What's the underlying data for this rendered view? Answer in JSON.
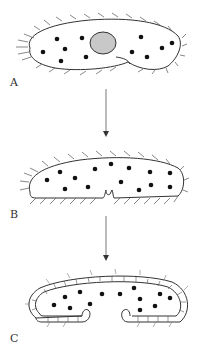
{
  "diagram": {
    "stages": [
      {
        "label": "A",
        "description": "ciliated cell with central nucleus and scattered dots, folding at one end"
      },
      {
        "label": "B",
        "description": "elongated ciliated cell with ventral notch"
      },
      {
        "label": "C",
        "description": "cell enclosed by double-layered wall with inward-curving opening"
      }
    ],
    "arrows": [
      {
        "from": "A",
        "to": "B"
      },
      {
        "from": "B",
        "to": "C"
      }
    ],
    "colors": {
      "stroke": "#333333",
      "dot": "#111111",
      "nucleus_fill": "#c8c8c8",
      "background": "#ffffff"
    }
  }
}
